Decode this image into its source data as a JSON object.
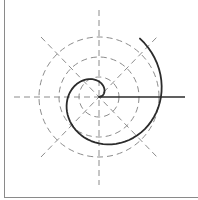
{
  "diagram": {
    "title": "",
    "center": {
      "x": 99,
      "y": 97
    },
    "colors": {
      "guide": "#8c8c8c",
      "spiral": "#2b2b2b",
      "axis_ray": "#2b2b2b",
      "border": "#8a8a8a",
      "background": "#ffffff"
    },
    "guide_circles": [
      {
        "r": 20
      },
      {
        "r": 40
      },
      {
        "r": 60
      }
    ],
    "guide_lines": [
      {
        "name": "horizontal",
        "x1": 14,
        "y1": 97,
        "x2": 99,
        "y2": 97
      },
      {
        "name": "vertical",
        "x1": 99,
        "y1": 10,
        "x2": 99,
        "y2": 185
      },
      {
        "name": "diagonal-down",
        "x1": 41,
        "y1": 37,
        "x2": 157,
        "y2": 157
      },
      {
        "name": "diagonal-up",
        "x1": 41,
        "y1": 157,
        "x2": 157,
        "y2": 37
      }
    ],
    "axis_ray": {
      "x1": 99,
      "y1": 97,
      "x2": 185,
      "y2": 97
    },
    "spiral": {
      "type": "archimedean",
      "r_per_degree": 0.172,
      "start_deg": 0,
      "end_deg": 415,
      "step_deg": 5,
      "direction": "counterclockwise"
    }
  }
}
